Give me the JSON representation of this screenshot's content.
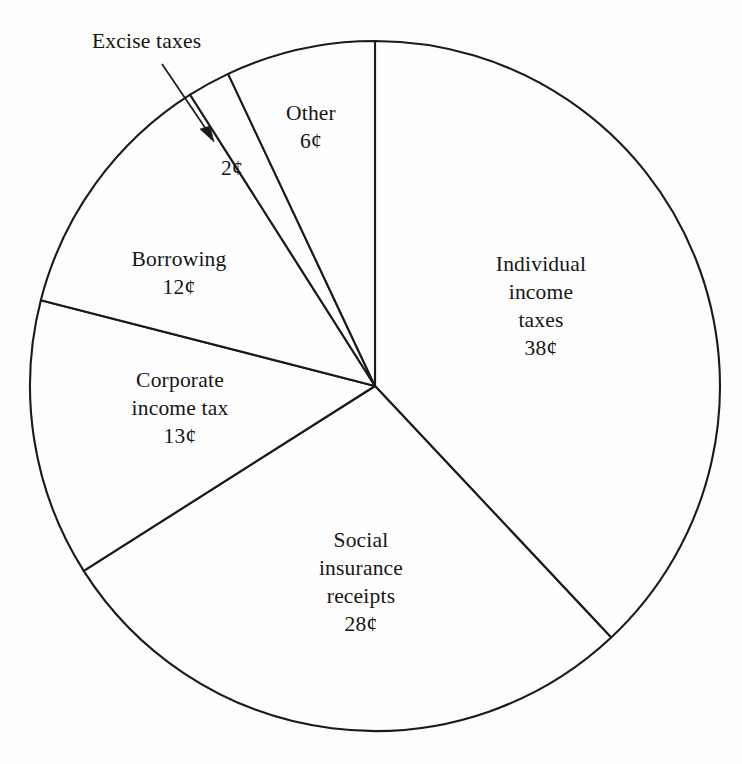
{
  "figure": {
    "background_color": "#fdfdfc",
    "stroke_color": "#1a1a1a",
    "fill_color": "#fefefe"
  },
  "callout": {
    "excise_label": "Excise taxes"
  },
  "chart_data": {
    "type": "pie",
    "title": "",
    "subtitle": "",
    "xlabel": "",
    "ylabel": "",
    "unit": "¢",
    "total": 100,
    "start_angle_deg": 0,
    "direction": "clockwise",
    "legend": "none",
    "grid": false,
    "labels_inside": true,
    "center": {
      "x": 375,
      "y": 386
    },
    "radius": 345,
    "slices": [
      {
        "name": "individual-income-taxes",
        "label_lines": [
          "Individual",
          "income",
          "taxes"
        ],
        "value": 38,
        "value_label": "38¢",
        "start_deg": 0.0,
        "end_deg": 136.8,
        "callout": false
      },
      {
        "name": "social-insurance-receipts",
        "label_lines": [
          "Social",
          "insurance",
          "receipts"
        ],
        "value": 28,
        "value_label": "28¢",
        "start_deg": 136.8,
        "end_deg": 237.6,
        "callout": false
      },
      {
        "name": "corporate-income-tax",
        "label_lines": [
          "Corporate",
          "income tax"
        ],
        "value": 13,
        "value_label": "13¢",
        "start_deg": 237.6,
        "end_deg": 284.4,
        "callout": false
      },
      {
        "name": "borrowing",
        "label_lines": [
          "Borrowing"
        ],
        "value": 12,
        "value_label": "12¢",
        "start_deg": 284.4,
        "end_deg": 327.6,
        "callout": false
      },
      {
        "name": "excise-taxes",
        "label_lines": [],
        "value": 2,
        "value_label": "2¢",
        "start_deg": 327.6,
        "end_deg": 334.8,
        "callout": true,
        "callout_text": "Excise taxes"
      },
      {
        "name": "other",
        "label_lines": [
          "Other"
        ],
        "value": 6,
        "value_label": "6¢",
        "start_deg": 334.8,
        "end_deg": 360.0,
        "callout": false
      }
    ]
  }
}
